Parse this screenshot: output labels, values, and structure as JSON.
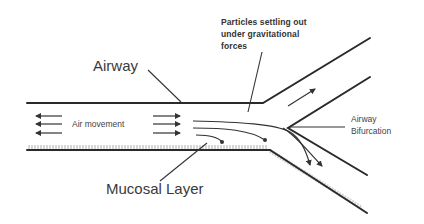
{
  "diagram": {
    "labels": {
      "airway": "Airway",
      "particles_line1": "Particles settling out",
      "particles_line2": "under gravitational",
      "particles_line3": "forces",
      "air_movement": "Air movement",
      "airway_bifurcation_line1": "Airway",
      "airway_bifurcation_line2": "Bifurcation",
      "mucosal_layer": "Mucosal Layer"
    },
    "colors": {
      "line": "#2a2a2a",
      "text": "#3a3a3a",
      "mucosa": "#cfcfcf",
      "background": "#ffffff"
    }
  }
}
